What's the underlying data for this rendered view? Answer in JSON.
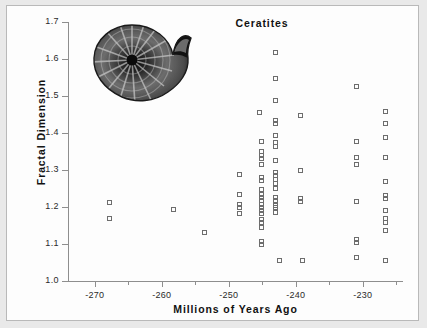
{
  "figure": {
    "title": "Ceratites",
    "background": "#fdfdfd",
    "border_color": "#b9b9b9",
    "marker_color": "#6d6d6d"
  },
  "inset": {
    "name": "ammonite-fossil-photo",
    "description": "Ceratites ammonite fossil specimen, grayscale photograph"
  },
  "chart_data": {
    "type": "scatter",
    "title": "Ceratites",
    "xlabel": "Millions of Years Ago",
    "ylabel": "Fractal Dimension",
    "xlim": [
      -274,
      -224
    ],
    "ylim": [
      1.0,
      1.7
    ],
    "grid": false,
    "legend": null,
    "xticks": [
      -270,
      -260,
      -250,
      -240,
      -230
    ],
    "xtick_labels": [
      "-270",
      "-260",
      "-250",
      "-240",
      "-230"
    ],
    "xminor_ticks": [
      -265,
      -255,
      -245,
      -235,
      -225
    ],
    "yticks": [
      1.0,
      1.1,
      1.2,
      1.3,
      1.4,
      1.5,
      1.6,
      1.7
    ],
    "ytick_labels": [
      "1.0",
      "1.1",
      "1.2",
      "1.3",
      "1.4",
      "1.5",
      "1.6",
      "1.7"
    ],
    "marker": "open-square",
    "series": [
      {
        "name": "Ceratites specimens",
        "points": [
          [
            -267.8,
            1.21
          ],
          [
            -267.8,
            1.168
          ],
          [
            -258.2,
            1.192
          ],
          [
            -253.5,
            1.131
          ],
          [
            -248.3,
            1.286
          ],
          [
            -248.3,
            1.232
          ],
          [
            -248.3,
            1.205
          ],
          [
            -248.3,
            1.196
          ],
          [
            -248.3,
            1.181
          ],
          [
            -245.4,
            1.455
          ],
          [
            -245.1,
            1.375
          ],
          [
            -245.1,
            1.348
          ],
          [
            -245.1,
            1.338
          ],
          [
            -245.1,
            1.33
          ],
          [
            -245.1,
            1.313
          ],
          [
            -245.1,
            1.279
          ],
          [
            -245.1,
            1.27
          ],
          [
            -245.1,
            1.245
          ],
          [
            -245.1,
            1.232
          ],
          [
            -245.1,
            1.224
          ],
          [
            -245.1,
            1.215
          ],
          [
            -245.1,
            1.206
          ],
          [
            -245.1,
            1.197
          ],
          [
            -245.1,
            1.188
          ],
          [
            -245.1,
            1.18
          ],
          [
            -245.1,
            1.164
          ],
          [
            -245.1,
            1.157
          ],
          [
            -245.1,
            1.143
          ],
          [
            -245.1,
            1.106
          ],
          [
            -245.1,
            1.097
          ],
          [
            -243.0,
            1.615
          ],
          [
            -243.0,
            1.546
          ],
          [
            -243.0,
            1.487
          ],
          [
            -243.0,
            1.432
          ],
          [
            -243.0,
            1.423
          ],
          [
            -243.0,
            1.392
          ],
          [
            -243.0,
            1.372
          ],
          [
            -243.0,
            1.362
          ],
          [
            -243.0,
            1.325
          ],
          [
            -243.0,
            1.292
          ],
          [
            -243.0,
            1.283
          ],
          [
            -243.0,
            1.272
          ],
          [
            -243.0,
            1.262
          ],
          [
            -243.0,
            1.25
          ],
          [
            -243.0,
            1.224
          ],
          [
            -243.0,
            1.215
          ],
          [
            -243.0,
            1.204
          ],
          [
            -243.0,
            1.196
          ],
          [
            -243.0,
            1.185
          ],
          [
            -242.4,
            1.054
          ],
          [
            -239.2,
            1.445
          ],
          [
            -239.2,
            1.296
          ],
          [
            -239.2,
            1.222
          ],
          [
            -239.2,
            1.214
          ],
          [
            -238.9,
            1.053
          ],
          [
            -230.8,
            1.525
          ],
          [
            -230.8,
            1.375
          ],
          [
            -230.8,
            1.333
          ],
          [
            -230.8,
            1.313
          ],
          [
            -230.8,
            1.214
          ],
          [
            -230.8,
            1.112
          ],
          [
            -230.8,
            1.103
          ],
          [
            -230.8,
            1.062
          ],
          [
            -226.6,
            1.458
          ],
          [
            -226.6,
            1.424
          ],
          [
            -226.6,
            1.387
          ],
          [
            -226.6,
            1.333
          ],
          [
            -226.6,
            1.268
          ],
          [
            -226.6,
            1.23
          ],
          [
            -226.6,
            1.221
          ],
          [
            -226.6,
            1.188
          ],
          [
            -226.6,
            1.167
          ],
          [
            -226.6,
            1.158
          ],
          [
            -226.6,
            1.136
          ],
          [
            -226.6,
            1.053
          ]
        ]
      }
    ]
  }
}
